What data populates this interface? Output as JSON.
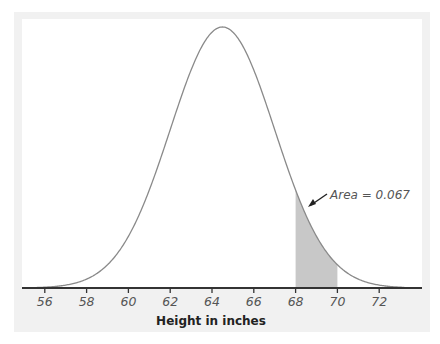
{
  "chart_data": {
    "type": "area",
    "title": "",
    "xlabel": "Height in inches",
    "ylabel": "",
    "distribution": {
      "name": "normal",
      "mean": 64.5,
      "sd": 2.5
    },
    "xlim": [
      55,
      73
    ],
    "x_ticks": [
      56,
      58,
      60,
      62,
      64,
      66,
      68,
      70,
      72
    ],
    "shaded_region": {
      "from": 68,
      "to": 70,
      "color": "#c8c8c8"
    },
    "annotations": [
      {
        "text": "Area = 0.067",
        "points_to": "shaded_region"
      }
    ],
    "grid": false,
    "legend": null
  },
  "colors": {
    "curve": "#8a8a8a",
    "axis": "#333333",
    "shade": "#c8c8c8",
    "frame": "#f1f1f1"
  }
}
